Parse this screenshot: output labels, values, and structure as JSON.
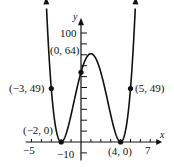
{
  "chart_data": {
    "type": "line",
    "title": "",
    "function": "f(x) = (x+2)^2 (x-4)^2",
    "xlabel": "x",
    "ylabel": "y",
    "xlim": [
      -5,
      7
    ],
    "ylim": [
      -10,
      100
    ],
    "x_tick_labels": [
      "-5",
      "7"
    ],
    "y_tick_labels": [
      "100",
      "-10"
    ],
    "x_tick_step": 1,
    "y_tick_step": 10,
    "grid": false,
    "labeled_points": [
      {
        "x": -3,
        "y": 49,
        "label": "(−3, 49)"
      },
      {
        "x": -2,
        "y": 0,
        "label": "(−2, 0)"
      },
      {
        "x": 0,
        "y": 64,
        "label": "(0, 64)"
      },
      {
        "x": 4,
        "y": 0,
        "label": "(4, 0)"
      },
      {
        "x": 5,
        "y": 49,
        "label": "(5, 49)"
      }
    ],
    "series": [
      {
        "name": "f(x)",
        "x": [
          -3.4,
          -3,
          -2,
          -1,
          0,
          1,
          2,
          3,
          4,
          5,
          5.4
        ],
        "values": [
          70.6,
          49,
          0,
          25,
          64,
          81,
          64,
          25,
          0,
          49,
          70.6
        ]
      }
    ]
  },
  "labels": {
    "x_axis": "x",
    "y_axis": "y",
    "y100": "100",
    "ym10": "−10",
    "xm5": "−5",
    "x7": "7",
    "p_m3": "(−3, 49)",
    "p_m2": "(−2, 0)",
    "p_0": "(0, 64)",
    "p_4": "(4, 0)",
    "p_5": "(5, 49)"
  }
}
